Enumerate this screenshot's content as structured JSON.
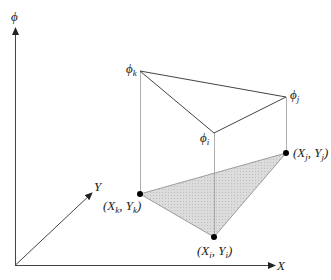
{
  "diagram": {
    "type": "3d-linear-triangular-element",
    "axes": {
      "phi_label": "ϕ",
      "x_label": "X",
      "y_label": "Y"
    },
    "top_nodes": {
      "k": {
        "symbol": "ϕ",
        "sub": "k"
      },
      "j": {
        "symbol": "ϕ",
        "sub": "j"
      },
      "i": {
        "symbol": "ϕ",
        "sub": "i"
      }
    },
    "base_nodes": {
      "k": {
        "open": "(X",
        "sub1": "k",
        "mid": ", Y",
        "sub2": "k",
        "close": ")"
      },
      "j": {
        "open": "(X",
        "sub1": "j",
        "mid": ", Y",
        "sub2": "j",
        "close": ")"
      },
      "i": {
        "open": "(X",
        "sub1": "i",
        "mid": ", Y",
        "sub2": "i",
        "close": ")"
      }
    },
    "colors": {
      "line": "#333333",
      "thin_line": "#777777",
      "fill": "#d9d9d9",
      "dot": "#000000"
    }
  }
}
